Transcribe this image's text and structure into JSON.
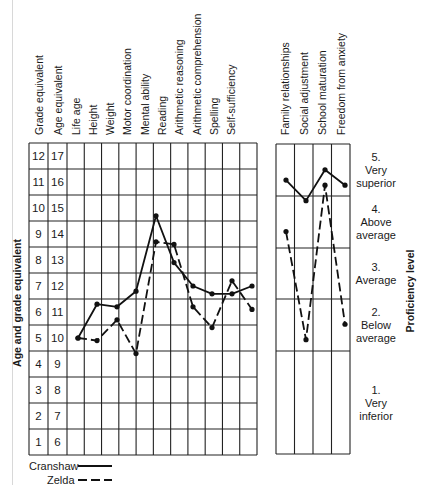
{
  "chart_data": [
    {
      "type": "line",
      "title": "",
      "ylabel": "Age and grade equivalent",
      "xlabel": "",
      "ylim": [
        0.5,
        12.5
      ],
      "grid": true,
      "y_ticks": {
        "grade_equivalent": [
          1,
          2,
          3,
          4,
          5,
          6,
          7,
          8,
          9,
          10,
          11,
          12
        ],
        "age_equivalent": [
          6,
          7,
          8,
          9,
          10,
          11,
          12,
          13,
          14,
          15,
          16,
          17
        ]
      },
      "axis_columns": [
        "Grade equivalent",
        "Age equivalent"
      ],
      "categories": [
        "Life age",
        "Height",
        "Weight",
        "Motor coordination",
        "Mental ability",
        "Reading",
        "Arithmetic reasoning",
        "Arithmetic comprehension",
        "Spelling",
        "Self-sufficiency"
      ],
      "series": [
        {
          "name": "Cranshaw",
          "style": "solid",
          "values": [
            5.0,
            6.3,
            6.2,
            6.8,
            9.7,
            7.9,
            7.0,
            6.7,
            6.7,
            7.0
          ]
        },
        {
          "name": "Zelda",
          "style": "dashed",
          "values": [
            5.0,
            4.9,
            5.7,
            4.4,
            8.7,
            8.6,
            6.2,
            5.4,
            7.2,
            6.1
          ]
        }
      ],
      "note": "Life age is shared starting point for both series; one extra blank column follows Life age grid"
    },
    {
      "type": "line",
      "title": "",
      "ylabel": "Proficiency level",
      "ylim": [
        1,
        5
      ],
      "grid": true,
      "categories": [
        "Family relationships",
        "Social adjustment",
        "School maturation",
        "Freedom from anxiety"
      ],
      "levels": [
        {
          "num": "5.",
          "line1": "Very",
          "line2": "superior"
        },
        {
          "num": "4.",
          "line1": "Above",
          "line2": "average"
        },
        {
          "num": "3.",
          "line1": "Average",
          "line2": ""
        },
        {
          "num": "2.",
          "line1": "Below",
          "line2": "average"
        },
        {
          "num": "1.",
          "line1": "Very",
          "line2": "inferior"
        }
      ],
      "series": [
        {
          "name": "Cranshaw",
          "style": "solid",
          "values": [
            4.8,
            4.4,
            5.0,
            4.7
          ]
        },
        {
          "name": "Zelda",
          "style": "dashed",
          "values": [
            3.8,
            1.7,
            4.7,
            2.0
          ]
        }
      ]
    }
  ],
  "left_columns": [
    "Grade equivalent",
    "Age equivalent",
    "Life age",
    "Height",
    "Weight",
    "Motor coordination",
    "Mental ability",
    "Reading",
    "Arithmetic reasoning",
    "Arithmetic comprehension",
    "Spelling",
    "Self-sufficiency"
  ],
  "right_columns": [
    "Family relationships",
    "Social adjustment",
    "School maturation",
    "Freedom from anxiety"
  ],
  "y_axis_label": "Age and grade equivalent",
  "right_axis_label": "Proficiency level",
  "legend": [
    {
      "name": "Cranshaw",
      "style": "solid"
    },
    {
      "name": "Zelda",
      "style": "dashed"
    }
  ]
}
